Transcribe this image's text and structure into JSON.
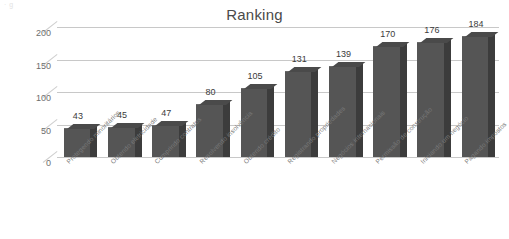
{
  "top_sliver_text": "· g",
  "chart_data": {
    "type": "bar",
    "title": "Ranking",
    "xlabel": "",
    "ylabel": "",
    "ylim": [
      0,
      200
    ],
    "yticks": [
      0,
      50,
      100,
      150,
      200
    ],
    "grid": true,
    "legend": "none",
    "style": "3d-column",
    "bar_color": "#555555",
    "bar_side_color": "#3c3c3c",
    "grid_color": "#c8c8c8",
    "categories": [
      "Protegendo minoritários",
      "Obtendo eletricidade",
      "Cumprindo contratos",
      "Resolvendo insolvência",
      "Obtendo crédito",
      "Registrando propriedades",
      "Negócios internacionais",
      "Permissão de construção",
      "Iniciando um negócio",
      "Pagando impostos"
    ],
    "values": [
      43,
      45,
      47,
      80,
      105,
      131,
      139,
      170,
      176,
      184
    ]
  }
}
